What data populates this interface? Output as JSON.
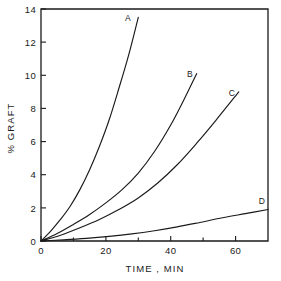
{
  "chart_data": {
    "type": "line",
    "title": "",
    "xlabel": "TIME , MIN",
    "ylabel": "% GRAFT",
    "xlim": [
      0,
      70
    ],
    "ylim": [
      0,
      14
    ],
    "grid": false,
    "legend": "inline-curve-labels",
    "x_major_ticks": [
      0,
      20,
      40,
      60
    ],
    "x_major_tick_labels": [
      "0",
      "20",
      "40",
      "60"
    ],
    "x_minor_ticks": [
      10,
      30,
      50,
      70
    ],
    "y_major_ticks": [
      0,
      2,
      4,
      6,
      8,
      10,
      12,
      14
    ],
    "y_major_tick_labels": [
      "0",
      "2",
      "4",
      "6",
      "8",
      "10",
      "12",
      "14"
    ],
    "series": [
      {
        "name": "A",
        "label": "A",
        "color": "#1a1a1a",
        "x": [
          0,
          3,
          6,
          9,
          12,
          15,
          18,
          21,
          24,
          27,
          30
        ],
        "y": [
          0.0,
          0.6,
          1.3,
          2.1,
          3.1,
          4.3,
          5.7,
          7.3,
          9.2,
          11.2,
          13.5
        ]
      },
      {
        "name": "B",
        "label": "B",
        "color": "#1a1a1a",
        "x": [
          0,
          5,
          10,
          15,
          20,
          25,
          30,
          35,
          40,
          44,
          48
        ],
        "y": [
          0.0,
          0.45,
          1.0,
          1.6,
          2.3,
          3.1,
          4.1,
          5.4,
          7.0,
          8.5,
          10.1
        ]
      },
      {
        "name": "C",
        "label": "C",
        "color": "#1a1a1a",
        "x": [
          0,
          6,
          12,
          18,
          24,
          30,
          36,
          42,
          48,
          54,
          61
        ],
        "y": [
          0.0,
          0.35,
          0.8,
          1.3,
          1.9,
          2.6,
          3.5,
          4.6,
          5.9,
          7.3,
          9.0
        ]
      },
      {
        "name": "D",
        "label": "D",
        "color": "#1a1a1a",
        "x": [
          0,
          7,
          14,
          21,
          28,
          35,
          42,
          49,
          56,
          63,
          70
        ],
        "y": [
          0.0,
          0.07,
          0.16,
          0.28,
          0.43,
          0.62,
          0.85,
          1.12,
          1.4,
          1.65,
          1.9
        ]
      }
    ]
  },
  "axes": {
    "y_labels": {
      "t0": "0",
      "t2": "2",
      "t4": "4",
      "t6": "6",
      "t8": "8",
      "t10": "10",
      "t12": "12",
      "t14": "14"
    },
    "x_labels": {
      "t0": "0",
      "t20": "20",
      "t40": "40",
      "t60": "60"
    },
    "x_title": "TIME , MIN",
    "y_title": "% GRAFT"
  },
  "curve_labels": {
    "a": "A",
    "b": "B",
    "c": "C",
    "d": "D"
  }
}
